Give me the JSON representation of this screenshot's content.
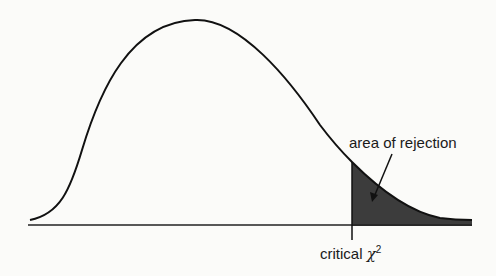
{
  "diagram": {
    "type": "chi-square distribution with rejection region",
    "annotations": {
      "rejection_area": "area of rejection",
      "critical_prefix": "critical",
      "critical_symbol": "χ",
      "critical_superscript": "2"
    },
    "colors": {
      "curve": "#111111",
      "shaded_region": "#3c3c3c",
      "background": "#fbfbf9"
    }
  }
}
